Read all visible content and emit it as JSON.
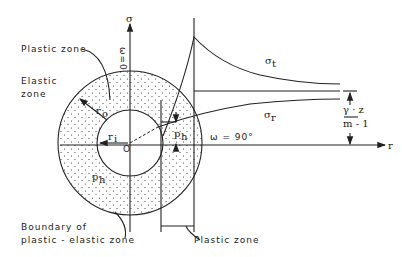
{
  "labels": {
    "plastic_zone": "Plastic zone",
    "elastic_zone_1": "Elastic",
    "elastic_zone_2": "zone",
    "boundary_1": "Boundary of",
    "boundary_2": "plastic - elastic zone",
    "plastic_zone_bottom": "Plastic zone",
    "sigma_axis": "σ",
    "omega_zero": "ω=0",
    "omega_ninety": "ω = 90°",
    "r_axis": "r",
    "origin": "O",
    "ri": "r",
    "ri_sub": "i",
    "ro": "r",
    "ro_sub": "o",
    "ph_left": "p",
    "ph_left_sub": "h",
    "ph_right": "p",
    "ph_right_sub": "h",
    "sigma_t": "σ",
    "sigma_t_sub": "t",
    "sigma_r": "σ",
    "sigma_r_sub": "r",
    "frac_num": "γ · z",
    "frac_den": "m - 1"
  }
}
